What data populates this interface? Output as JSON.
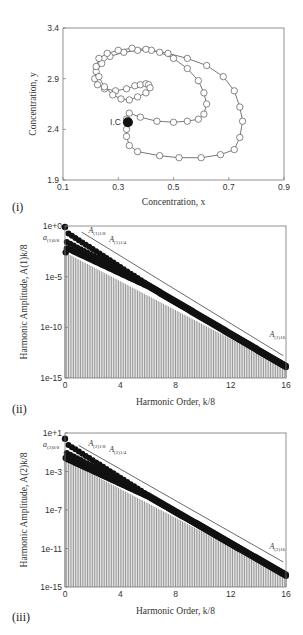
{
  "chart_data": [
    {
      "id": "i",
      "panel_label": "(i)",
      "type": "line",
      "title": "",
      "xlabel": "Concentration, x",
      "ylabel": "Concentration, y",
      "xlim": [
        0.1,
        0.9
      ],
      "ylim": [
        1.9,
        3.4
      ],
      "xticks": [
        "0.1",
        "0.3",
        "0.5",
        "0.7",
        "0.9"
      ],
      "yticks": [
        "1.9",
        "2.4",
        "2.9",
        "3.4"
      ],
      "grid": false,
      "marker": "open-circle",
      "annotation": {
        "text": "I.C",
        "x": 0.335,
        "y": 2.47,
        "marker": "filled-circle"
      },
      "series": [
        {
          "name": "trajectory",
          "x": [
            0.335,
            0.33,
            0.33,
            0.34,
            0.37,
            0.45,
            0.52,
            0.6,
            0.67,
            0.72,
            0.74,
            0.75,
            0.74,
            0.72,
            0.68,
            0.62,
            0.55,
            0.48,
            0.42,
            0.37,
            0.32,
            0.27,
            0.24,
            0.22,
            0.215,
            0.225,
            0.25,
            0.29,
            0.33,
            0.36,
            0.38,
            0.4,
            0.41,
            0.415,
            0.4,
            0.37,
            0.34,
            0.31,
            0.28,
            0.25,
            0.23,
            0.22,
            0.23,
            0.26,
            0.3,
            0.35,
            0.4,
            0.45,
            0.5,
            0.55,
            0.59,
            0.61,
            0.62,
            0.61,
            0.59,
            0.55,
            0.5,
            0.44,
            0.38,
            0.34,
            0.33,
            0.335
          ],
          "y": [
            2.47,
            2.4,
            2.33,
            2.24,
            2.18,
            2.14,
            2.12,
            2.12,
            2.15,
            2.2,
            2.32,
            2.48,
            2.62,
            2.78,
            2.92,
            3.03,
            3.1,
            3.15,
            3.18,
            3.18,
            3.16,
            3.12,
            3.05,
            2.97,
            2.9,
            2.84,
            2.8,
            2.78,
            2.8,
            2.83,
            2.84,
            2.85,
            2.84,
            2.81,
            2.76,
            2.72,
            2.69,
            2.7,
            2.74,
            2.82,
            2.92,
            3.02,
            3.1,
            3.15,
            3.18,
            3.2,
            3.19,
            3.16,
            3.1,
            3.0,
            2.88,
            2.76,
            2.65,
            2.55,
            2.5,
            2.48,
            2.47,
            2.48,
            2.52,
            2.56,
            2.5,
            2.47
          ]
        }
      ]
    },
    {
      "id": "ii",
      "panel_label": "(ii)",
      "type": "bar",
      "xlabel": "Harmonic Order, k/8",
      "ylabel": "Harmonic Amplitude, A(1)k/8",
      "yscale": "log",
      "xlim": [
        0,
        16
      ],
      "ylim": [
        1e-15,
        1
      ],
      "xticks": [
        "0",
        "4",
        "8",
        "12",
        "16"
      ],
      "yticks": [
        "1e+0",
        "1e-5",
        "1e-10",
        "1e-15"
      ],
      "grid": false,
      "annotations": [
        {
          "text": "a(1)0/8",
          "k": 0.0,
          "log10": -0.2
        },
        {
          "text": "A(1)1/8",
          "k": 1.7,
          "log10": -0.7
        },
        {
          "text": "A(1)1/4",
          "k": 3.2,
          "log10": -1.6
        },
        {
          "text": "A(1)16",
          "k": 14.8,
          "log10": -11.0
        }
      ],
      "trend_line": {
        "k": [
          1.2,
          15.8
        ],
        "log10": [
          -0.6,
          -12.8
        ]
      },
      "series": [
        {
          "name": "harmonic k/8 (mod 8 = 0 branch, upper)",
          "k_start": 0,
          "log10_start": -0.1,
          "log10_end": -13.6
        },
        {
          "name": "lower branch",
          "k_start": 0.25,
          "log10_start": -2.5,
          "log10_end": -13.9
        }
      ],
      "bar_top_log10": {
        "k0": -2.6,
        "k16": -14.0
      },
      "sample_points": {
        "k": [
          0,
          0.125,
          0.25,
          0.375,
          0.5,
          0.75,
          1,
          2,
          4,
          8,
          12,
          16
        ],
        "log10_amplitude": [
          -0.1,
          -2.6,
          -1.3,
          -1.9,
          -0.8,
          -1.5,
          -1.0,
          -2.2,
          -4.3,
          -7.8,
          -10.9,
          -13.8
        ]
      }
    },
    {
      "id": "iii",
      "panel_label": "(iii)",
      "type": "bar",
      "xlabel": "Harmonic Order, k/8",
      "ylabel": "Harmonic Amplitude, A(2)k/8",
      "yscale": "log",
      "xlim": [
        0,
        16
      ],
      "ylim": [
        1e-15,
        10
      ],
      "xticks": [
        "0",
        "4",
        "8",
        "12",
        "16"
      ],
      "yticks": [
        "1e+1",
        "1e-3",
        "1e-7",
        "1e-11",
        "1e-15"
      ],
      "grid": false,
      "annotations": [
        {
          "text": "a(2)0/8",
          "k": 0.0,
          "log10": 0.5
        },
        {
          "text": "A(2)1/8",
          "k": 1.7,
          "log10": -0.3
        },
        {
          "text": "A(2)1/4",
          "k": 3.2,
          "log10": -1.0
        },
        {
          "text": "A(2)16",
          "k": 14.8,
          "log10": -11.0
        }
      ],
      "trend_line": {
        "k": [
          1.0,
          15.8
        ],
        "log10": [
          -0.3,
          -12.4
        ]
      },
      "sample_points": {
        "k": [
          0,
          0.125,
          0.25,
          0.375,
          0.5,
          0.75,
          1,
          2,
          4,
          8,
          12,
          16
        ],
        "log10_amplitude": [
          0.4,
          -1.6,
          -0.6,
          -1.2,
          -0.2,
          -0.9,
          -0.5,
          -1.8,
          -3.8,
          -7.3,
          -10.5,
          -13.7
        ]
      },
      "bar_top_log10": {
        "k0": -1.8,
        "k16": -13.8
      }
    }
  ],
  "labels": {
    "ic": "I.C",
    "panel_i": "(i)",
    "panel_ii": "(ii)",
    "panel_iii": "(iii)"
  }
}
